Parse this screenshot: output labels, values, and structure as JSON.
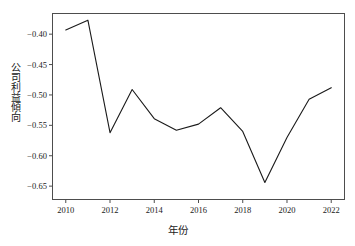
{
  "chart_data": {
    "type": "line",
    "title": "",
    "xlabel": "年份",
    "ylabel": "公司利益傾向",
    "x": [
      2010,
      2011,
      2012,
      2013,
      2014,
      2015,
      2016,
      2017,
      2018,
      2019,
      2020,
      2021,
      2022
    ],
    "values": [
      -0.393,
      -0.377,
      -0.562,
      -0.491,
      -0.539,
      -0.558,
      -0.548,
      -0.521,
      -0.56,
      -0.644,
      -0.57,
      -0.507,
      -0.488
    ],
    "series": [
      {
        "name": "公司利益傾向",
        "values": [
          -0.393,
          -0.377,
          -0.562,
          -0.491,
          -0.539,
          -0.558,
          -0.548,
          -0.521,
          -0.56,
          -0.644,
          -0.57,
          -0.507,
          -0.488
        ]
      }
    ],
    "xlim": [
      2009.4,
      2022.6
    ],
    "ylim": [
      -0.672,
      -0.366
    ],
    "xticks": [
      2010,
      2012,
      2014,
      2016,
      2018,
      2020,
      2022
    ],
    "xtick_labels": [
      "2010",
      "2012",
      "2014",
      "2016",
      "2018",
      "2020",
      "2022"
    ],
    "yticks": [
      -0.4,
      -0.45,
      -0.5,
      -0.55,
      -0.6,
      -0.65
    ],
    "ytick_labels": [
      "−0.40",
      "−0.45",
      "−0.50",
      "−0.55",
      "−0.60",
      "−0.65"
    ],
    "grid": false,
    "legend": "none",
    "line_color": "#1a1a1a",
    "line_width": 1.1,
    "frame_color": "#4d4d4d",
    "background": "#ffffff"
  }
}
